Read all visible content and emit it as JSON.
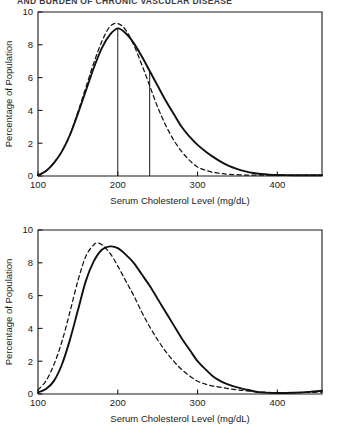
{
  "header": {
    "title": "AND BURDEN OF CHRONIC VASCULAR DISEASE"
  },
  "figures": [
    {
      "name": "cholesterol-distribution-chart-1",
      "chart_data": {
        "type": "line",
        "title": "",
        "xlabel": "Serum Cholesterol Level (mg/dL)",
        "ylabel": "Percentage of Population",
        "xlim": [
          100,
          456
        ],
        "ylim": [
          0,
          10
        ],
        "xticks": [
          100,
          200,
          300,
          400
        ],
        "yticks": [
          0,
          2,
          4,
          6,
          8,
          10
        ],
        "grid": false,
        "legend": "none",
        "series": [
          {
            "name": "solid-curve",
            "style": "solid",
            "x": [
              100,
              110,
              120,
              130,
              140,
              150,
              160,
              170,
              180,
              190,
              200,
              210,
              220,
              230,
              240,
              250,
              260,
              270,
              280,
              290,
              300,
              310,
              320,
              330,
              340,
              350,
              360,
              370,
              380,
              390,
              400,
              420,
              440,
              456
            ],
            "values": [
              0.05,
              0.3,
              0.8,
              1.5,
              2.5,
              3.8,
              5.2,
              6.6,
              7.8,
              8.6,
              9.0,
              8.7,
              8.1,
              7.3,
              6.4,
              5.5,
              4.6,
              3.8,
              3.0,
              2.4,
              1.9,
              1.5,
              1.15,
              0.85,
              0.6,
              0.42,
              0.28,
              0.18,
              0.12,
              0.08,
              0.06,
              0.05,
              0.05,
              0.05
            ]
          },
          {
            "name": "dashed-curve",
            "style": "dashed",
            "x": [
              100,
              110,
              120,
              130,
              140,
              150,
              160,
              170,
              180,
              190,
              200,
              210,
              220,
              230,
              240,
              250,
              260,
              270,
              280,
              290,
              300,
              310,
              320,
              330,
              340,
              360,
              380,
              400,
              420,
              440,
              456
            ],
            "values": [
              0.05,
              0.3,
              0.8,
              1.5,
              2.5,
              3.9,
              5.4,
              6.9,
              8.2,
              9.1,
              9.3,
              8.9,
              8.0,
              6.8,
              5.5,
              4.2,
              3.1,
              2.2,
              1.5,
              0.95,
              0.55,
              0.35,
              0.22,
              0.15,
              0.1,
              0.06,
              0.05,
              0.05,
              0.05,
              0.05,
              0.05
            ]
          }
        ],
        "vlines": [
          {
            "name": "median-marker",
            "x": 200,
            "y_top": 9.0
          },
          {
            "name": "threshold-marker",
            "x": 240,
            "y_top": 6.35
          }
        ]
      }
    },
    {
      "name": "cholesterol-distribution-chart-2",
      "chart_data": {
        "type": "line",
        "title": "",
        "xlabel": "Serum Cholesterol Level (mg/dL)",
        "ylabel": "Percentage of Population",
        "xlim": [
          100,
          456
        ],
        "ylim": [
          0,
          10
        ],
        "xticks": [
          100,
          200,
          300,
          400
        ],
        "yticks": [
          0,
          2,
          4,
          6,
          8,
          10
        ],
        "grid": false,
        "legend": "none",
        "series": [
          {
            "name": "solid-curve",
            "style": "solid",
            "x": [
              100,
              110,
              120,
              130,
              140,
              150,
              160,
              170,
              180,
              190,
              200,
              210,
              220,
              230,
              240,
              250,
              260,
              270,
              280,
              290,
              300,
              310,
              320,
              330,
              340,
              350,
              360,
              370,
              380,
              390,
              400,
              420,
              440,
              456
            ],
            "values": [
              0.1,
              0.3,
              0.8,
              1.8,
              3.3,
              5.1,
              6.9,
              8.1,
              8.8,
              9.0,
              8.9,
              8.5,
              8.0,
              7.3,
              6.6,
              5.8,
              5.0,
              4.2,
              3.4,
              2.7,
              2.0,
              1.5,
              1.05,
              0.75,
              0.55,
              0.4,
              0.28,
              0.17,
              0.1,
              0.07,
              0.06,
              0.08,
              0.13,
              0.2
            ]
          },
          {
            "name": "dashed-curve",
            "style": "dashed",
            "x": [
              100,
              110,
              120,
              130,
              140,
              150,
              160,
              170,
              175,
              180,
              190,
              200,
              210,
              220,
              230,
              240,
              250,
              260,
              270,
              280,
              290,
              300,
              310,
              320,
              330,
              340,
              350,
              360,
              380,
              400,
              420,
              440,
              456
            ],
            "values": [
              0.25,
              0.8,
              1.8,
              3.2,
              5.0,
              6.9,
              8.4,
              9.1,
              9.2,
              9.1,
              8.6,
              7.8,
              6.9,
              6.0,
              5.0,
              4.1,
              3.3,
              2.6,
              2.0,
              1.5,
              1.1,
              0.78,
              0.6,
              0.48,
              0.4,
              0.32,
              0.25,
              0.2,
              0.12,
              0.08,
              0.08,
              0.1,
              0.12
            ]
          }
        ],
        "vlines": []
      }
    }
  ]
}
